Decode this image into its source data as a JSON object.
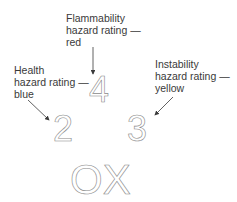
{
  "labels": {
    "flammability": {
      "line1": "Flammability",
      "line2": "hazard rating —",
      "line3": "red"
    },
    "health": {
      "line1": "Health",
      "line2": "hazard rating —",
      "line3": "blue"
    },
    "instability": {
      "line1": "Instability",
      "line2": "hazard rating —",
      "line3": "yellow"
    }
  },
  "values": {
    "flammability": "4",
    "health": "2",
    "instability": "3",
    "special": "OX"
  },
  "colors": {
    "text": "#3a3a3a",
    "outline": "#8a8a8a",
    "arrow": "#3a3a3a"
  }
}
